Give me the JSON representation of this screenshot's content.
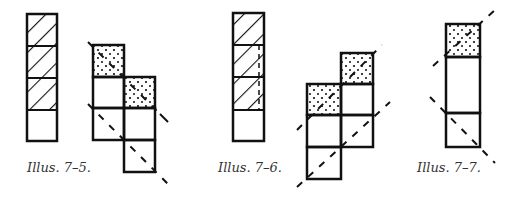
{
  "figures": [
    {
      "id": "7-5",
      "caption": "Illus. 7–5."
    },
    {
      "id": "7-6",
      "caption": "Illus. 7–6."
    },
    {
      "id": "7-7",
      "caption": "Illus. 7–7."
    }
  ],
  "colors": {
    "ink": "#111111",
    "background": "#ffffff"
  }
}
